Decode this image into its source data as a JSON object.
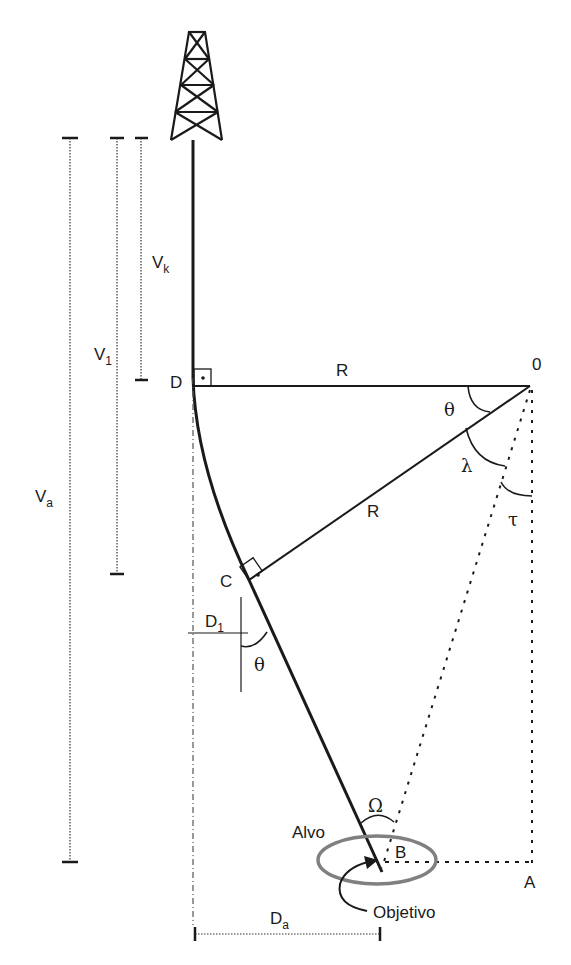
{
  "diagram": {
    "type": "directional-well-geometry",
    "labels": {
      "vk": {
        "main": "V",
        "sub": "k"
      },
      "v1": {
        "main": "V",
        "sub": "1"
      },
      "va": {
        "main": "V",
        "sub": "a"
      },
      "d1": {
        "main": "D",
        "sub": "1"
      },
      "da": {
        "main": "D",
        "sub": "a"
      },
      "point_d": "D",
      "point_c": "C",
      "point_o": "0",
      "point_b": "B",
      "point_a": "A",
      "radius_top": "R",
      "radius_mid": "R",
      "theta_top": "θ",
      "theta_bottom": "θ",
      "lambda": "λ",
      "tau": "τ",
      "omega": "Ω",
      "target": "Alvo",
      "objective": "Objetivo"
    },
    "colors": {
      "line": "#1a1a1a",
      "target_ellipse": "#808080",
      "background": "#ffffff"
    }
  }
}
